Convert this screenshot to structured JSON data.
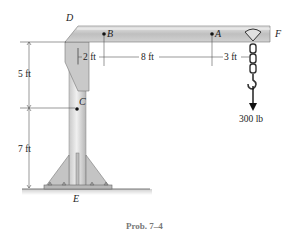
{
  "figure": {
    "caption": "Prob. 7–4",
    "points": {
      "D": "D",
      "B": "B",
      "A": "A",
      "F": "F",
      "C": "C",
      "E": "E"
    },
    "dimensions": {
      "horizontal": [
        "2 ft",
        "8 ft",
        "3 ft"
      ],
      "vertical": [
        "5 ft",
        "7 ft"
      ]
    },
    "load": {
      "label": "300 lb",
      "direction": "down"
    },
    "colors": {
      "steel_light": "#d9d9d9",
      "steel_mid": "#bdbdbd",
      "steel_dark": "#9a9a9a",
      "line": "#333333",
      "dim_line": "#555555",
      "caption": "#777777"
    }
  }
}
